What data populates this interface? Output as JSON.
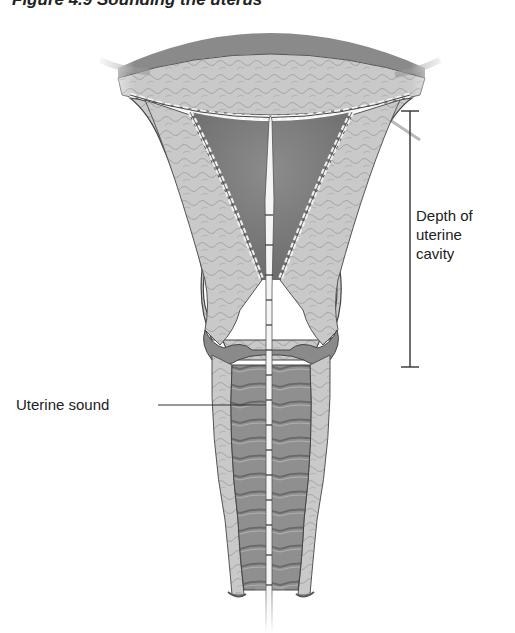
{
  "figure": {
    "title": "Figure 4.9  Sounding the uterus"
  },
  "labels": {
    "depth_line1": "Depth of",
    "depth_line2": "uterine",
    "depth_line3": "cavity",
    "sound": "Uterine sound"
  },
  "measurement": {
    "bracket_top_y": 111,
    "bracket_bottom_y": 367,
    "bracket_x": 410
  },
  "colors": {
    "background": "#ffffff",
    "tissue_light": "#cfcfcf",
    "tissue_mid": "#a8a8a8",
    "cavity_dark": "#7a7a7a",
    "outline": "#3a3a3a",
    "text": "#222222"
  }
}
